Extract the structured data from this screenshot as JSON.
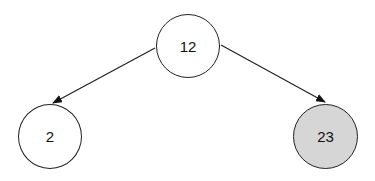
{
  "diagram": {
    "type": "binary-tree",
    "nodes": [
      {
        "id": "root",
        "label": "12",
        "fill": "#ffffff"
      },
      {
        "id": "left",
        "label": "2",
        "fill": "#ffffff"
      },
      {
        "id": "right",
        "label": "23",
        "fill": "#d6d6d6"
      }
    ],
    "edges": [
      {
        "from": "root",
        "to": "left"
      },
      {
        "from": "root",
        "to": "right"
      }
    ]
  }
}
